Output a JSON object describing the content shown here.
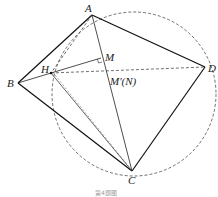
{
  "diagram": {
    "type": "geometry",
    "labels": {
      "A": "A",
      "B": "B",
      "C": "C",
      "D": "D",
      "H": "H",
      "M": "M",
      "N": "M′(N)"
    },
    "caption": "第4题图",
    "points": {
      "A": [
        92,
        15
      ],
      "B": [
        18,
        83
      ],
      "C": [
        132,
        171
      ],
      "D": [
        205,
        67
      ],
      "H": [
        51,
        73
      ],
      "M": [
        101,
        58
      ],
      "N": [
        107,
        71
      ]
    },
    "circle": {
      "cx": 134,
      "cy": 94,
      "r": 82,
      "style": "dashed"
    },
    "solid_segments": [
      "AB",
      "BC",
      "CD",
      "DA",
      "AC",
      "HM",
      "BH",
      "HC"
    ],
    "dashed_segments": [
      "HD",
      "AH",
      "HC-dashed"
    ],
    "right_angle_at": "M"
  }
}
